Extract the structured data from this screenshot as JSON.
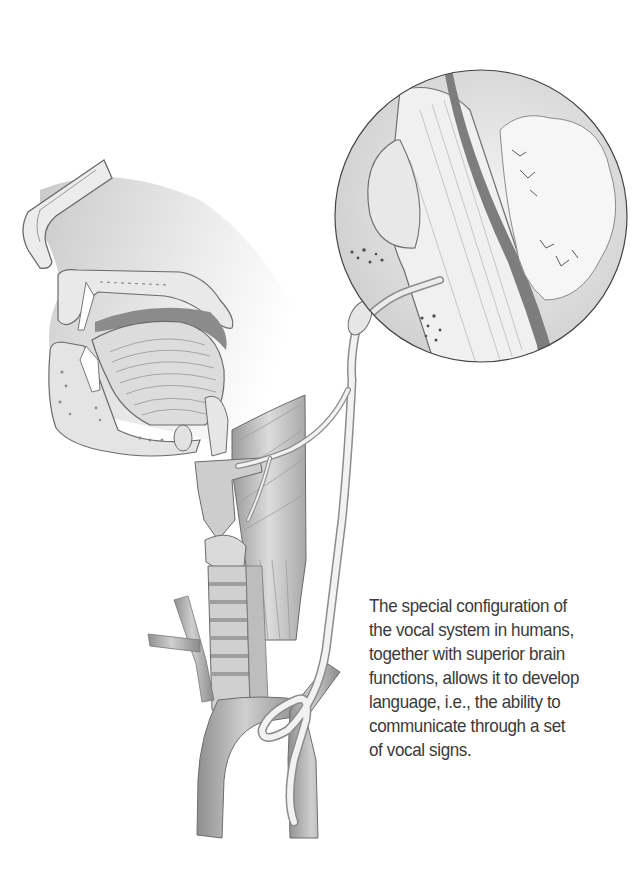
{
  "figure": {
    "parts": [
      "head-sagittal-section",
      "nasal-cavity",
      "palate",
      "tongue",
      "lower-jaw",
      "larynx",
      "trachea",
      "neck-muscles",
      "aortic-arch",
      "vagus-nerve",
      "recurrent-laryngeal-nerve",
      "magnified-inset-brainstem"
    ],
    "inset": {
      "shape": "circle",
      "cx": 481,
      "cy": 216,
      "r": 146
    },
    "colors": {
      "background": "#ffffff",
      "tissue_light": "#efefef",
      "tissue_mid": "#c8c8c8",
      "tissue_dark": "#8a8a8a",
      "outline": "#555555",
      "caption_text": "#3a3a3a"
    }
  },
  "caption": {
    "lines": [
      "The special configuration of",
      "the vocal system in humans,",
      "together with superior brain",
      "functions, allows it to develop",
      "language, i.e., the ability to",
      "communicate through a set",
      "of vocal signs."
    ]
  }
}
